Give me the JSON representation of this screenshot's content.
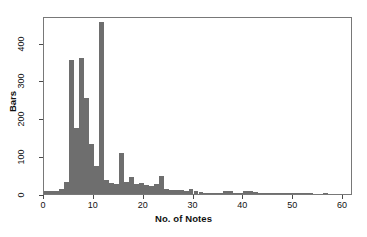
{
  "chart_data": {
    "type": "bar",
    "title": "",
    "subtitle": "",
    "xlabel": "No. of Notes",
    "ylabel": "Bars",
    "xlim": [
      0,
      62
    ],
    "ylim": [
      0,
      470
    ],
    "xticks": [
      0,
      10,
      20,
      30,
      40,
      50,
      60
    ],
    "yticks": [
      0,
      100,
      200,
      300,
      400
    ],
    "grid": false,
    "legend": null,
    "bar_color": "#6e6e6e",
    "frame_color": "#787878",
    "bar_width": 1,
    "categories": [
      1,
      2,
      3,
      4,
      5,
      6,
      7,
      8,
      9,
      10,
      11,
      12,
      13,
      14,
      15,
      16,
      17,
      18,
      19,
      20,
      21,
      22,
      23,
      24,
      25,
      26,
      27,
      28,
      29,
      30,
      31,
      32,
      33,
      34,
      35,
      36,
      37,
      38,
      39,
      40,
      41,
      42,
      43,
      44,
      45,
      46,
      47,
      48,
      49,
      50,
      51,
      52,
      53,
      54,
      55,
      56,
      57
    ],
    "values": [
      8,
      8,
      9,
      14,
      33,
      353,
      175,
      360,
      253,
      131,
      73,
      455,
      36,
      30,
      27,
      107,
      31,
      44,
      26,
      29,
      25,
      22,
      27,
      48,
      12,
      11,
      11,
      10,
      7,
      13,
      8,
      5,
      3,
      1,
      1,
      4,
      9,
      8,
      2,
      4,
      7,
      9,
      5,
      3,
      3,
      2,
      2,
      2,
      3,
      3,
      1,
      1,
      1,
      1,
      0,
      0,
      1
    ]
  },
  "axes": {
    "x_tick_labels": [
      "0",
      "10",
      "20",
      "30",
      "40",
      "50",
      "60"
    ],
    "y_tick_labels": [
      "0",
      "100",
      "200",
      "300",
      "400"
    ]
  }
}
